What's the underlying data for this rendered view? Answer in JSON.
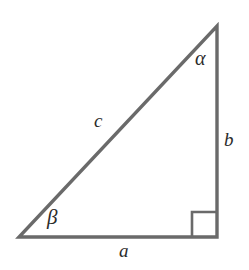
{
  "figure": {
    "type": "right-triangle-diagram",
    "background_color": "#ffffff",
    "stroke_color": "#6a6a6a",
    "label_color": "#2b2b2b",
    "stroke_width": 3,
    "vertices": {
      "bottom_left": [
        19,
        237
      ],
      "bottom_right": [
        217,
        237
      ],
      "apex": [
        217,
        26
      ]
    },
    "right_angle_marker": {
      "at_vertex": "bottom_right",
      "size": 25,
      "x": 192,
      "y": 212
    },
    "labels": {
      "alpha": "α",
      "beta": "β",
      "side_a": "a",
      "side_b": "b",
      "side_c": "c"
    },
    "label_meaning": {
      "alpha": "angle at apex (top vertex)",
      "beta": "angle at bottom-left vertex",
      "side_a": "horizontal base (bottom side)",
      "side_b": "vertical side (right side)",
      "side_c": "hypotenuse"
    }
  }
}
